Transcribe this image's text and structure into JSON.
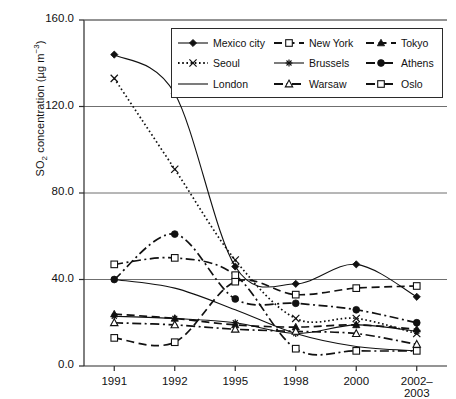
{
  "chart_data": {
    "type": "line",
    "title": "",
    "xlabel": "",
    "ylabel": "SO2 concentration (µg m-3)",
    "ylabel_parts": {
      "pre": "SO",
      "sub": "2",
      "mid": " concentration (µg m",
      "sup": "−3",
      "post": ")"
    },
    "categories": [
      "1991",
      "1992",
      "1995",
      "1998",
      "2000",
      "2002–2003"
    ],
    "ylim": [
      0.0,
      160.0
    ],
    "yticks": [
      "0.0",
      "40.0",
      "80.0",
      "120.0",
      "160.0"
    ],
    "ytick_values": [
      0,
      40,
      80,
      120,
      160
    ],
    "grid": "horizontal",
    "legend_position": "top-right-inside",
    "series": [
      {
        "name": "Mexico city",
        "marker": "filled-diamond",
        "dash": "solid",
        "values": [
          144,
          126,
          46,
          38,
          47,
          32
        ]
      },
      {
        "name": "New York",
        "marker": "open-square",
        "dash": "long-dash",
        "values": [
          13,
          11,
          39,
          33,
          36,
          37
        ]
      },
      {
        "name": "Tokyo",
        "marker": "filled-triangle",
        "dash": "long-dash",
        "values": [
          24,
          22,
          19,
          18,
          19,
          17
        ]
      },
      {
        "name": "Seoul",
        "marker": "cross-x",
        "dash": "dotted",
        "values": [
          133,
          91,
          49,
          22,
          22,
          15
        ]
      },
      {
        "name": "Brussels",
        "marker": "asterisk",
        "dash": "solid",
        "values": [
          23,
          22,
          20,
          15,
          19,
          16
        ]
      },
      {
        "name": "Athens",
        "marker": "filled-circle",
        "dash": "dash-dot",
        "values": [
          40,
          61,
          31,
          29,
          26,
          20
        ]
      },
      {
        "name": "London",
        "marker": "none",
        "dash": "solid",
        "values": [
          40,
          36,
          26,
          15,
          9,
          7
        ]
      },
      {
        "name": "Warsaw",
        "marker": "open-triangle",
        "dash": "dash-dot",
        "values": [
          20,
          19,
          17,
          16,
          15,
          10
        ]
      },
      {
        "name": "Oslo",
        "marker": "open-square",
        "dash": "dash-dot",
        "values": [
          47,
          50,
          42,
          8,
          7,
          7
        ]
      }
    ]
  },
  "legend": {
    "items": [
      {
        "label": "Mexico city"
      },
      {
        "label": "New York"
      },
      {
        "label": "Tokyo"
      },
      {
        "label": "Seoul"
      },
      {
        "label": "Brussels"
      },
      {
        "label": "Athens"
      },
      {
        "label": "London"
      },
      {
        "label": "Warsaw"
      },
      {
        "label": "Oslo"
      }
    ]
  },
  "colors": {
    "ink": "#111111",
    "axis": "#2b2b2b",
    "grid": "#6f6f6f",
    "background": "#ffffff"
  }
}
